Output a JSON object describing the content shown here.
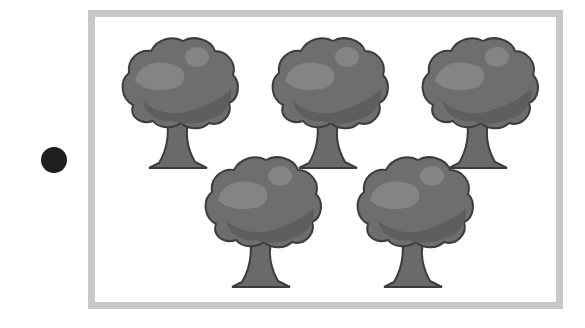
{
  "marker": {
    "icon": "filled-circle-icon",
    "color": "#1e1e1e"
  },
  "frame": {
    "border_color": "#c8c8c8"
  },
  "trees": {
    "count": 5,
    "rows": [
      {
        "count": 3,
        "positions": [
          [
            115,
            33
          ],
          [
            265,
            33
          ],
          [
            415,
            33
          ]
        ]
      },
      {
        "count": 2,
        "positions": [
          [
            198,
            152
          ],
          [
            350,
            152
          ]
        ]
      }
    ],
    "colors": {
      "canopy": "#6e6e6e",
      "canopy_dark": "#5e5e5e",
      "highlight": "#8a8a8a",
      "trunk": "#6a6a6a",
      "outline": "#3c3c3c"
    }
  }
}
